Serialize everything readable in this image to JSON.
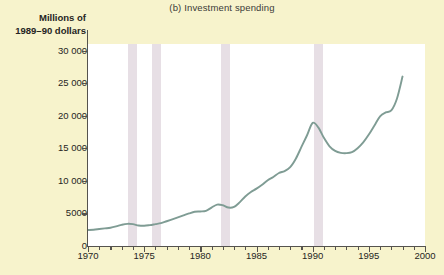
{
  "chart_data": {
    "type": "line",
    "title": "(b) Investment spending",
    "ylabel_line1": "Millions of",
    "ylabel_line2": "1989–90 dollars",
    "xlabel": "",
    "xlim": [
      1970,
      2000
    ],
    "ylim": [
      0,
      31000
    ],
    "grid": false,
    "legend": "none",
    "ytick_labels": [
      "0",
      "5000",
      "10 000",
      "15 000",
      "20 000",
      "25 000",
      "30 000"
    ],
    "ytick_values": [
      0,
      5000,
      10000,
      15000,
      20000,
      25000,
      30000
    ],
    "xtick_labels": [
      "1970",
      "1975",
      "1980",
      "1985",
      "1990",
      "1995",
      "2000"
    ],
    "xtick_values": [
      1970,
      1975,
      1980,
      1985,
      1990,
      1995,
      2000
    ],
    "xtick_minor_step": 1,
    "series": [
      {
        "name": "Investment spending",
        "color": "#7f9c94",
        "x": [
          1970.0,
          1970.5,
          1971.0,
          1971.5,
          1972.0,
          1972.5,
          1973.0,
          1973.5,
          1974.0,
          1974.5,
          1975.0,
          1975.5,
          1976.0,
          1976.5,
          1977.0,
          1977.5,
          1978.0,
          1978.5,
          1979.0,
          1979.5,
          1980.0,
          1980.5,
          1981.0,
          1981.5,
          1982.0,
          1982.5,
          1983.0,
          1983.5,
          1984.0,
          1984.5,
          1985.0,
          1985.5,
          1986.0,
          1986.5,
          1987.0,
          1987.5,
          1988.0,
          1988.5,
          1989.0,
          1989.5,
          1990.0,
          1990.5,
          1991.0,
          1991.5,
          1992.0,
          1992.5,
          1993.0,
          1993.5,
          1994.0,
          1994.5,
          1995.0,
          1995.5,
          1996.0,
          1996.5,
          1997.0,
          1997.5,
          1998.0
        ],
        "y": [
          2450,
          2500,
          2600,
          2700,
          2800,
          3000,
          3250,
          3400,
          3350,
          3150,
          3100,
          3200,
          3350,
          3500,
          3800,
          4100,
          4400,
          4700,
          5000,
          5250,
          5300,
          5400,
          5900,
          6350,
          6250,
          5900,
          6000,
          6700,
          7600,
          8300,
          8800,
          9400,
          10100,
          10600,
          11200,
          11500,
          12100,
          13400,
          15200,
          17000,
          18900,
          18200,
          16600,
          15300,
          14600,
          14300,
          14250,
          14400,
          15000,
          15900,
          17100,
          18500,
          19900,
          20500,
          20800,
          22600,
          26000
        ]
      }
    ],
    "recession_bands": [
      {
        "name": "recession-1974",
        "start": 1973.6,
        "end": 1974.4
      },
      {
        "name": "recession-1976",
        "start": 1975.7,
        "end": 1976.5
      },
      {
        "name": "recession-1982",
        "start": 1981.8,
        "end": 1982.6
      },
      {
        "name": "recession-1990",
        "start": 1990.1,
        "end": 1990.9
      }
    ],
    "colors": {
      "background": "#f7f3cc",
      "plot_background": "#ffffff",
      "line": "#7f9c94",
      "recession_band": "#e3d9e0",
      "axis": "#55534e",
      "text": "#262523"
    }
  }
}
